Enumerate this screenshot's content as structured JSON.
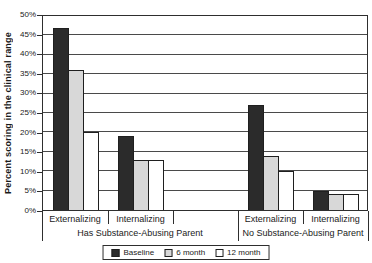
{
  "chart_data": {
    "type": "bar",
    "title": "",
    "xlabel": "",
    "ylabel": "Percent scoring in the clinical range",
    "ylim": [
      0,
      50
    ],
    "ytick_step": 5,
    "ytick_labels": [
      "50%",
      "45%",
      "40%",
      "35%",
      "30%",
      "25%",
      "20%",
      "15%",
      "10%",
      "5%",
      "0%"
    ],
    "grid": true,
    "legend_position": "bottom",
    "categories": [
      "Externalizing",
      "Internalizing",
      "Externalizing",
      "Internalizing"
    ],
    "group_labels": [
      "Has Substance-Abusing Parent",
      "No Substance-Abusing Parent"
    ],
    "series": [
      {
        "name": "Baseline",
        "color": "#2b2b2b",
        "values": [
          47,
          19,
          27,
          5
        ]
      },
      {
        "name": "6 month",
        "color": "#d8d8d8",
        "values": [
          36,
          13,
          14,
          4
        ]
      },
      {
        "name": "12 month",
        "color": "#ffffff",
        "values": [
          20,
          13,
          10,
          4
        ]
      }
    ],
    "colors": {
      "axis": "#2e2e2e",
      "grid": "#4a4a4a",
      "text": "#1a1a1a",
      "background": "#ffffff"
    }
  }
}
